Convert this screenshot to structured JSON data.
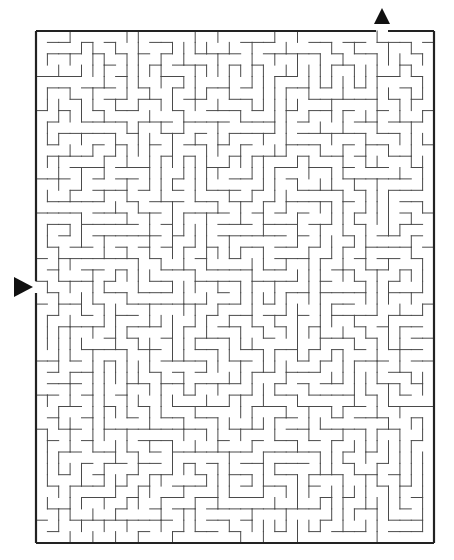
{
  "puzzle": {
    "type": "rectangular-maze",
    "colors": {
      "background": "#ffffff",
      "wall": "#4a4a4a",
      "border": "#222222",
      "arrow": "#111111"
    },
    "frame": {
      "left": 36,
      "top": 31,
      "right": 434,
      "bottom": 543
    },
    "grid": {
      "cols": 35,
      "rows": 45,
      "cell_w": 11.37,
      "cell_h": 11.38
    },
    "seed": 20240611,
    "entrance": {
      "side": "left",
      "gap": {
        "y1": 281,
        "y2": 293
      },
      "arrow": {
        "icon": "right-pointing-triangle",
        "points": "14,277 33,287 14,297"
      }
    },
    "exit": {
      "side": "top",
      "gap": {
        "x1": 376,
        "x2": 388
      },
      "arrow": {
        "icon": "up-pointing-triangle",
        "points": "374,24 382,8 390,24"
      }
    }
  }
}
